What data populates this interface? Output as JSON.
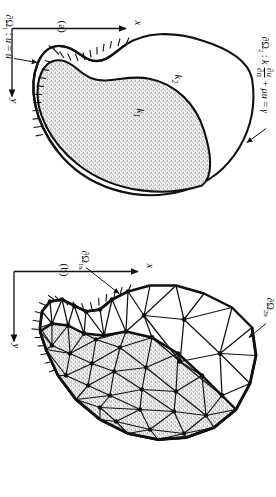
{
  "figure": {
    "type": "two-panel scientific diagram"
  },
  "panel_a": {
    "caption": "(a)",
    "region_inner_label": "k",
    "region_inner_sub": "1",
    "region_outer_label": "k",
    "region_outer_sub": "2",
    "bc_dirichlet": {
      "boundary": "∂Ω",
      "boundary_sub": "1",
      "separator": " :  ",
      "equation_lhs": "u",
      "equation_eq": " = ",
      "equation_rhs": "û"
    },
    "bc_robin": {
      "boundary": "∂Ω",
      "boundary_sub": "2",
      "separator": " :  ",
      "coefficient": "k",
      "frac_num": "∂u",
      "frac_den": "∂n",
      "plus": " + ",
      "mu_term": "μu",
      "equals": " = ",
      "gamma": "γ"
    },
    "axis_x": "x",
    "axis_y": "y"
  },
  "panel_b": {
    "caption": "(b)",
    "bc_dirichlet_h": {
      "boundary": "∂Ω",
      "boundary_sub": "1h"
    },
    "bc_robin_h": {
      "boundary": "∂Ω",
      "boundary_sub": "2h"
    },
    "axis_x": "x",
    "axis_y": "y"
  },
  "colors": {
    "ink": "#111111",
    "stipple": "#4a4a4a",
    "paper": "#ffffff"
  }
}
